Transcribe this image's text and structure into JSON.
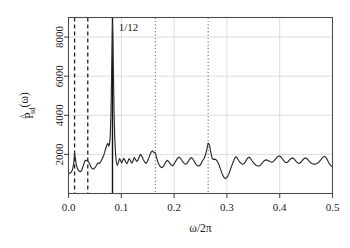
{
  "chart_data": {
    "type": "line",
    "title": "",
    "xlabel": "ω/2π",
    "ylabel": "P̂sd(ω)",
    "ylabel_base": "P",
    "ylabel_sub": "sd",
    "ylabel_arg": "(ω)",
    "xlim": [
      0.0,
      0.5
    ],
    "ylim": [
      0,
      9000
    ],
    "xticks": [
      0.0,
      0.1,
      0.2,
      0.3,
      0.4,
      0.5
    ],
    "xticklabels": [
      "0.0",
      "0.1",
      "0.2",
      "0.3",
      "0.4",
      "0.5"
    ],
    "yticks": [
      2000,
      4000,
      6000,
      8000
    ],
    "yticklabels": [
      "2000",
      "4000",
      "6000",
      "8000"
    ],
    "grid": "horizontal-and-vertical-light-gray",
    "legend": "none",
    "annotations": [
      {
        "text": "1/12",
        "x": 0.095,
        "y": 8300
      }
    ],
    "vlines": [
      {
        "x": 0.0115,
        "style": "dashed",
        "color": "#222222"
      },
      {
        "x": 0.0365,
        "style": "dashed",
        "color": "#222222"
      },
      {
        "x": 0.0833,
        "style": "solid",
        "color": "#111111"
      },
      {
        "x": 0.1645,
        "style": "dotted",
        "color": "#777777"
      },
      {
        "x": 0.2645,
        "style": "dotted",
        "color": "#777777"
      }
    ],
    "series": [
      {
        "name": "smoothed periodogram",
        "color": "#2b2b2b",
        "x": [
          0.002,
          0.004,
          0.006,
          0.008,
          0.01,
          0.0115,
          0.013,
          0.015,
          0.017,
          0.019,
          0.021,
          0.023,
          0.025,
          0.027,
          0.029,
          0.031,
          0.033,
          0.035,
          0.0365,
          0.0385,
          0.0405,
          0.0425,
          0.0445,
          0.0465,
          0.0485,
          0.0505,
          0.0525,
          0.0545,
          0.0565,
          0.0585,
          0.061,
          0.0635,
          0.066,
          0.0685,
          0.0705,
          0.0725,
          0.0745,
          0.076,
          0.0775,
          0.079,
          0.0805,
          0.0818,
          0.0828,
          0.0833,
          0.084,
          0.085,
          0.0862,
          0.0875,
          0.089,
          0.0905,
          0.0925,
          0.0945,
          0.0965,
          0.0985,
          0.1005,
          0.1025,
          0.1045,
          0.1065,
          0.1085,
          0.1105,
          0.1125,
          0.1145,
          0.1165,
          0.1185,
          0.1205,
          0.1225,
          0.1245,
          0.1265,
          0.129,
          0.1315,
          0.134,
          0.1365,
          0.139,
          0.1415,
          0.144,
          0.1465,
          0.149,
          0.1515,
          0.154,
          0.1565,
          0.159,
          0.1615,
          0.1645,
          0.167,
          0.1695,
          0.172,
          0.1745,
          0.177,
          0.1795,
          0.182,
          0.1845,
          0.187,
          0.1895,
          0.192,
          0.1945,
          0.197,
          0.1995,
          0.202,
          0.2045,
          0.207,
          0.2095,
          0.212,
          0.2145,
          0.217,
          0.2195,
          0.222,
          0.2245,
          0.227,
          0.2295,
          0.232,
          0.2345,
          0.237,
          0.2395,
          0.242,
          0.2445,
          0.247,
          0.2495,
          0.252,
          0.2545,
          0.257,
          0.2595,
          0.262,
          0.2645,
          0.267,
          0.2695,
          0.272,
          0.2745,
          0.277,
          0.2795,
          0.282,
          0.2845,
          0.287,
          0.2895,
          0.292,
          0.2945,
          0.297,
          0.2995,
          0.302,
          0.3045,
          0.307,
          0.3095,
          0.312,
          0.3145,
          0.317,
          0.3195,
          0.322,
          0.3245,
          0.327,
          0.3295,
          0.332,
          0.3345,
          0.337,
          0.3395,
          0.342,
          0.3445,
          0.347,
          0.3495,
          0.352,
          0.3545,
          0.357,
          0.3595,
          0.362,
          0.3645,
          0.367,
          0.3695,
          0.372,
          0.3745,
          0.377,
          0.3795,
          0.382,
          0.3845,
          0.387,
          0.3895,
          0.392,
          0.3945,
          0.397,
          0.3995,
          0.402,
          0.4045,
          0.407,
          0.4095,
          0.412,
          0.4145,
          0.417,
          0.4195,
          0.422,
          0.4245,
          0.427,
          0.4295,
          0.432,
          0.4345,
          0.437,
          0.4395,
          0.442,
          0.4445,
          0.447,
          0.4495,
          0.452,
          0.4545,
          0.457,
          0.4595,
          0.462,
          0.4645,
          0.467,
          0.4695,
          0.472,
          0.4745,
          0.477,
          0.4795,
          0.482,
          0.4845,
          0.487,
          0.4895,
          0.492,
          0.4945,
          0.497,
          0.499
        ],
        "y": [
          1030,
          1060,
          1120,
          1250,
          1560,
          2080,
          1800,
          1430,
          1270,
          1180,
          1130,
          1120,
          1200,
          1340,
          1500,
          1660,
          1700,
          1680,
          1660,
          1600,
          1480,
          1360,
          1280,
          1250,
          1270,
          1330,
          1420,
          1520,
          1560,
          1540,
          1620,
          1760,
          1900,
          2100,
          2300,
          2480,
          2560,
          2420,
          2500,
          2900,
          4100,
          6400,
          7900,
          8700,
          8100,
          6300,
          4300,
          2900,
          2050,
          1620,
          1440,
          1580,
          1780,
          1700,
          1560,
          1660,
          1800,
          1720,
          1600,
          1520,
          1640,
          1780,
          1720,
          1600,
          1560,
          1700,
          1840,
          1760,
          1640,
          1700,
          1880,
          2000,
          1900,
          1740,
          1620,
          1540,
          1620,
          1780,
          1960,
          2120,
          2180,
          2100,
          2080,
          1820,
          1600,
          1440,
          1360,
          1320,
          1380,
          1500,
          1620,
          1700,
          1640,
          1540,
          1460,
          1420,
          1480,
          1600,
          1720,
          1820,
          1860,
          1800,
          1700,
          1600,
          1540,
          1500,
          1540,
          1640,
          1760,
          1840,
          1800,
          1700,
          1580,
          1480,
          1420,
          1400,
          1460,
          1580,
          1700,
          1800,
          1980,
          2260,
          2580,
          2480,
          2120,
          1800,
          1740,
          1760,
          1720,
          1640,
          1500,
          1320,
          1120,
          940,
          820,
          760,
          800,
          900,
          1060,
          1260,
          1440,
          1620,
          1780,
          1880,
          1820,
          1700,
          1600,
          1540,
          1500,
          1520,
          1600,
          1720,
          1820,
          1860,
          1800,
          1700,
          1600,
          1520,
          1460,
          1420,
          1400,
          1420,
          1480,
          1560,
          1640,
          1700,
          1720,
          1700,
          1660,
          1620,
          1600,
          1620,
          1680,
          1760,
          1840,
          1900,
          1920,
          1880,
          1800,
          1700,
          1620,
          1580,
          1600,
          1660,
          1740,
          1800,
          1820,
          1780,
          1700,
          1620,
          1560,
          1540,
          1580,
          1660,
          1740,
          1800,
          1820,
          1780,
          1700,
          1620,
          1560,
          1520,
          1500,
          1500,
          1520,
          1560,
          1620,
          1700,
          1780,
          1860,
          1900,
          1860,
          1760,
          1620,
          1500,
          1420,
          1380
        ]
      }
    ]
  }
}
